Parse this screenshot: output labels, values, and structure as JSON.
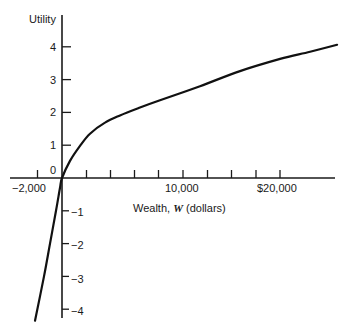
{
  "chart_data": {
    "type": "line",
    "title": "",
    "xlabel": "Wealth, W (dollars)",
    "xlabel_parts": {
      "prefix": "Wealth, ",
      "var": "W",
      "suffix": " (dollars)"
    },
    "ylabel": "Utility",
    "xlim": [
      -4900,
      25000
    ],
    "ylim": [
      -4.3,
      4.5
    ],
    "grid": false,
    "legend": null,
    "x_tick_labels": [
      {
        "value": -2000,
        "label": "−2,000"
      },
      {
        "value": 10000,
        "label": "10,000"
      },
      {
        "value": 20000,
        "label": "$20,000"
      }
    ],
    "x_tick_count": 10,
    "y_ticks": [
      {
        "value": 4,
        "label": "4"
      },
      {
        "value": 3,
        "label": "3"
      },
      {
        "value": 2,
        "label": "2"
      },
      {
        "value": 1,
        "label": "1"
      },
      {
        "value": 0,
        "label": "0"
      },
      {
        "value": -1,
        "label": "−1"
      },
      {
        "value": -2,
        "label": "−2"
      },
      {
        "value": -3,
        "label": "−3"
      },
      {
        "value": -4,
        "label": "−4"
      }
    ],
    "series": [
      {
        "name": "Utility function U(W)",
        "x": [
          -2470,
          -1650,
          -1100,
          -550,
          -180,
          0,
          730,
          1650,
          2560,
          3930,
          5310,
          7140,
          8970,
          12630,
          16290,
          19950,
          22700,
          25170
        ],
        "y": [
          -4.35,
          -3.0,
          -2.0,
          -1.0,
          -0.3,
          0.0,
          0.52,
          0.98,
          1.35,
          1.69,
          1.91,
          2.15,
          2.37,
          2.8,
          3.26,
          3.63,
          3.85,
          4.06
        ]
      }
    ]
  }
}
